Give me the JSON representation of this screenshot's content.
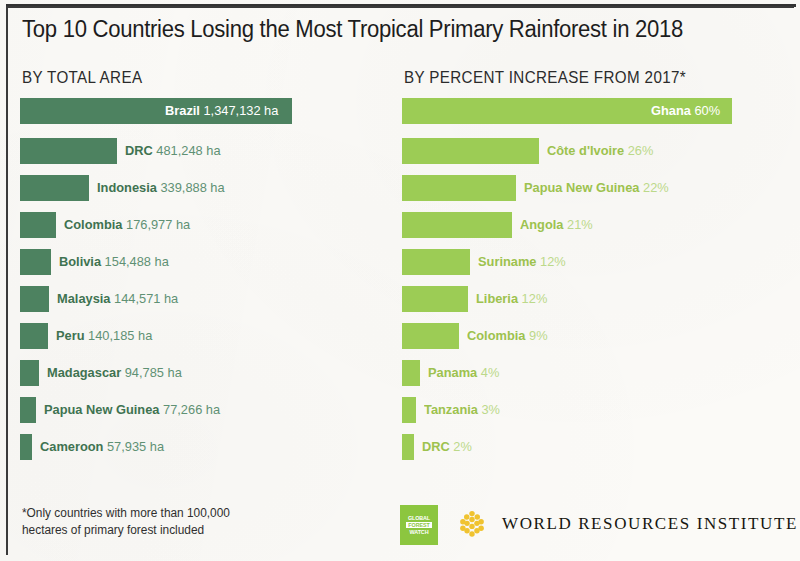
{
  "header": {
    "title": "Top 10 Countries Losing the Most Tropical Primary Rainforest in 2018",
    "subhead_left": "BY TOTAL AREA",
    "subhead_right": "BY PERCENT INCREASE FROM 2017*"
  },
  "footer": {
    "footnote_line1": "*Only countries with more than 100,000",
    "footnote_line2": "hectares of primary forest included",
    "gfw_line1": "GLOBAL",
    "gfw_line2": "FOREST",
    "gfw_line3": "WATCH",
    "wri_name": "WORLD RESOURCES INSTITUTE"
  },
  "colors": {
    "dark_green": "#4d8260",
    "light_green": "#9ccc55",
    "gfw_green": "#8cc63f",
    "wri_gold": "#f0c330",
    "paper": "#fbfaf7"
  },
  "chart_data": [
    {
      "type": "bar",
      "title": "BY TOTAL AREA",
      "orientation": "horizontal",
      "unit": "ha",
      "xlabel": "",
      "ylabel": "",
      "grid": false,
      "legend": false,
      "xlim": [
        0,
        1347132
      ],
      "categories": [
        "Brazil",
        "DRC",
        "Indonesia",
        "Colombia",
        "Bolivia",
        "Malaysia",
        "Peru",
        "Madagascar",
        "Papua New Guinea",
        "Cameroon"
      ],
      "values": [
        1347132,
        481248,
        339888,
        176977,
        154488,
        144571,
        140185,
        94785,
        77266,
        57935
      ],
      "value_labels": [
        "1,347,132 ha",
        "481,248 ha",
        "339,888 ha",
        "176,977 ha",
        "154,488 ha",
        "144,571 ha",
        "140,185 ha",
        "94,785 ha",
        "77,266 ha",
        "57,935 ha"
      ],
      "bars": [
        {
          "name": "Brazil",
          "value": 1347132,
          "label": "1,347,132 ha",
          "bar_px": 272,
          "label_inside": true
        },
        {
          "name": "DRC",
          "value": 481248,
          "label": "481,248 ha",
          "bar_px": 97,
          "label_inside": false
        },
        {
          "name": "Indonesia",
          "value": 339888,
          "label": "339,888 ha",
          "bar_px": 69,
          "label_inside": false
        },
        {
          "name": "Colombia",
          "value": 176977,
          "label": "176,977 ha",
          "bar_px": 36,
          "label_inside": false
        },
        {
          "name": "Bolivia",
          "value": 154488,
          "label": "154,488 ha",
          "bar_px": 31,
          "label_inside": false
        },
        {
          "name": "Malaysia",
          "value": 144571,
          "label": "144,571 ha",
          "bar_px": 29,
          "label_inside": false
        },
        {
          "name": "Peru",
          "value": 140185,
          "label": "140,185 ha",
          "bar_px": 28,
          "label_inside": false
        },
        {
          "name": "Madagascar",
          "value": 94785,
          "label": "94,785 ha",
          "bar_px": 19,
          "label_inside": false
        },
        {
          "name": "Papua New Guinea",
          "value": 77266,
          "label": "77,266 ha",
          "bar_px": 16,
          "label_inside": false
        },
        {
          "name": "Cameroon",
          "value": 57935,
          "label": "57,935 ha",
          "bar_px": 12,
          "label_inside": false
        }
      ]
    },
    {
      "type": "bar",
      "title": "BY PERCENT INCREASE FROM 2017*",
      "orientation": "horizontal",
      "unit": "%",
      "xlabel": "",
      "ylabel": "",
      "grid": false,
      "legend": false,
      "xlim": [
        0,
        60
      ],
      "categories": [
        "Ghana",
        "Côte d'Ivoire",
        "Papua New Guinea",
        "Angola",
        "Suriname",
        "Liberia",
        "Colombia",
        "Panama",
        "Tanzania",
        "DRC"
      ],
      "values": [
        60,
        26,
        22,
        21,
        12,
        12,
        9,
        4,
        3,
        2
      ],
      "value_labels": [
        "60%",
        "26%",
        "22%",
        "21%",
        "12%",
        "12%",
        "9%",
        "4%",
        "3%",
        "2%"
      ],
      "bars": [
        {
          "name": "Ghana",
          "value": 60,
          "label": "60%",
          "bar_px": 330,
          "label_inside": true
        },
        {
          "name": "Côte d'Ivoire",
          "value": 26,
          "label": "26%",
          "bar_px": 137,
          "label_inside": false
        },
        {
          "name": "Papua New Guinea",
          "value": 22,
          "label": "22%",
          "bar_px": 114,
          "label_inside": false
        },
        {
          "name": "Angola",
          "value": 21,
          "label": "21%",
          "bar_px": 110,
          "label_inside": false
        },
        {
          "name": "Suriname",
          "value": 12,
          "label": "12%",
          "bar_px": 68,
          "label_inside": false
        },
        {
          "name": "Liberia",
          "value": 12,
          "label": "12%",
          "bar_px": 66,
          "label_inside": false
        },
        {
          "name": "Colombia",
          "value": 9,
          "label": "9%",
          "bar_px": 57,
          "label_inside": false
        },
        {
          "name": "Panama",
          "value": 4,
          "label": "4%",
          "bar_px": 18,
          "label_inside": false
        },
        {
          "name": "Tanzania",
          "value": 3,
          "label": "3%",
          "bar_px": 14,
          "label_inside": false
        },
        {
          "name": "DRC",
          "value": 2,
          "label": "2%",
          "bar_px": 12,
          "label_inside": false
        }
      ]
    }
  ]
}
